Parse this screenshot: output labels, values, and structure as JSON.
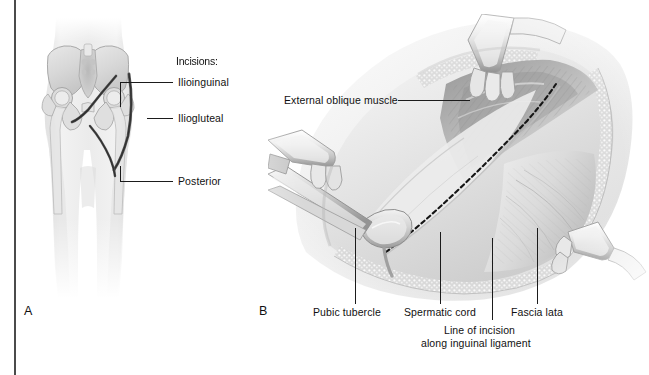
{
  "figure": {
    "type": "medical-illustration",
    "style": "grayscale pencil/airbrush anatomical drawing",
    "panels": [
      {
        "letter": "A",
        "name": "pelvis-incision-overview",
        "description": "Anterior view of pelvis and hips showing surgical incision locations"
      },
      {
        "letter": "B",
        "name": "inguinal-surgical-exposure",
        "description": "Surgical field exposure of the groin with retractors, external oblique muscle, spermatic cord and fascia lata"
      }
    ]
  },
  "panel_a": {
    "letter": "A",
    "legend_title": "Incisions:",
    "labels": [
      {
        "id": "ilioinguinal",
        "text": "Ilioinguinal"
      },
      {
        "id": "iliogluteal",
        "text": "Iliogluteal"
      },
      {
        "id": "posterior",
        "text": "Posterior"
      }
    ]
  },
  "panel_b": {
    "letter": "B",
    "labels": [
      {
        "id": "external-oblique-muscle",
        "text": "External oblique muscle"
      },
      {
        "id": "pubic-tubercle",
        "text": "Pubic tubercle"
      },
      {
        "id": "spermatic-cord",
        "text": "Spermatic cord"
      },
      {
        "id": "fascia-lata",
        "text": "Fascia lata"
      },
      {
        "id": "line-of-incision-1",
        "text": "Line of incision"
      },
      {
        "id": "line-of-incision-2",
        "text": "along inguinal ligament"
      }
    ]
  },
  "colors": {
    "background": "#ffffff",
    "ink": "#111111",
    "divider": "#4b4b4b",
    "tissue_light": "#f0f0f0",
    "tissue_mid": "#cfcfcf",
    "tissue_dark": "#8e8e8e",
    "shadow": "#6d6d6d"
  }
}
